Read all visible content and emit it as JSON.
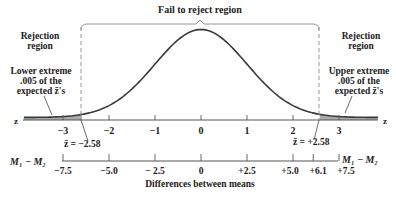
{
  "title": "Fail to reject region",
  "left_region": {
    "title_line1": "Rejection",
    "title_line2": "region",
    "tail_line1": "Lower extreme",
    "tail_line2": ".005 of the",
    "tail_line3": "expected z̄'s"
  },
  "right_region": {
    "title_line1": "Rejection",
    "title_line2": "region",
    "tail_line1": "Upper extreme",
    "tail_line2": ".005 of the",
    "tail_line3": "expected z̄'s"
  },
  "z_axis": {
    "label": "z",
    "ticks": [
      "−3",
      "−2",
      "−1",
      "0",
      "1",
      "2",
      "3"
    ],
    "critical_low": "z̄ = −2.58",
    "critical_high": "z̄ = +2.58"
  },
  "diff_axis": {
    "label_left": "M₁ − M₂",
    "label_right": "M₁ − M₂",
    "ticks": [
      "−7.5",
      "−5.0",
      "− 2.5",
      "0",
      "+2.5",
      "+5.0",
      "+6.1",
      "+7.5"
    ],
    "title": "Differences between means"
  },
  "chart_data": {
    "type": "area",
    "title": "Fail to reject region",
    "x": [
      -3.5,
      -3,
      -2.58,
      -2,
      -1,
      0,
      1,
      2,
      2.58,
      3,
      3.5
    ],
    "xlabel": "z",
    "critical_values": [
      -2.58,
      2.58
    ],
    "tail_probability_each": 0.005,
    "secondary_axis": {
      "label": "M1 − M2 (Differences between means)",
      "ticks": [
        -7.5,
        -5.0,
        -2.5,
        0,
        2.5,
        5.0,
        6.1,
        7.5
      ],
      "observed_difference": 6.1
    },
    "regions": [
      {
        "name": "Rejection region",
        "range": [
          "-inf",
          -2.58
        ]
      },
      {
        "name": "Fail to reject region",
        "range": [
          -2.58,
          2.58
        ]
      },
      {
        "name": "Rejection region",
        "range": [
          2.58,
          "inf"
        ]
      }
    ],
    "colors": {
      "curve": "#3a3a3a",
      "shade": "#a8a8a8",
      "axis": "#555555"
    }
  }
}
